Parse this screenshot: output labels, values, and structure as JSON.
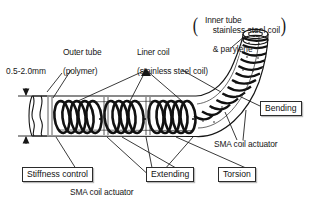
{
  "figure": {
    "type": "technical-diagram",
    "background_color": "#ffffff",
    "ink_color": "#161616"
  },
  "labels": {
    "dimension": {
      "text": "0.5-2.0mm",
      "kind": "tube-outer-diameter"
    },
    "outer_tube": {
      "line1": "Outer tube",
      "line2": "(polymer)"
    },
    "liner_coil": {
      "line1": "Liner coil",
      "line2": "(stainless steel coil)"
    },
    "inner_tube": {
      "line1": "Inner tube",
      "paren_open": "(",
      "paren_close": ")",
      "line2": "stainless steel coil",
      "line3": "& parylene"
    },
    "sma_right": {
      "text": "SMA coil actuator"
    },
    "sma_bottom": {
      "text": "SMA coil actuator"
    }
  },
  "boxed_callouts": [
    {
      "id": "bending",
      "label": "Bending"
    },
    {
      "id": "stiffness-control",
      "label": "Stiffness control"
    },
    {
      "id": "extending",
      "label": "Extending"
    },
    {
      "id": "torsion",
      "label": "Torsion"
    }
  ],
  "colors": {
    "stroke": "#161616",
    "box_border": "#2b2b2b",
    "box_shadow": "#b9b9b9",
    "tube_fill": "#ffffff",
    "coil_fill": "#1b1b1b"
  }
}
